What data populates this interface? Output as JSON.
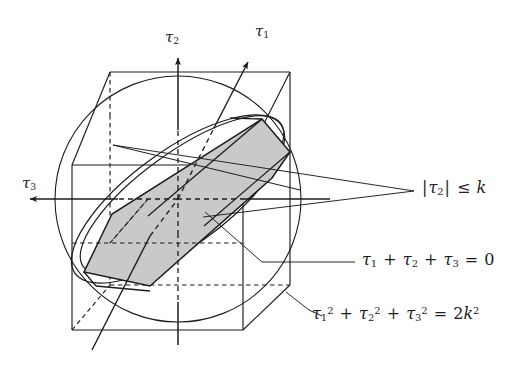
{
  "figure": {
    "background_color": "#ffffff",
    "line_color": "#1c1c1c",
    "thin_line_color": "#3a3a3a",
    "shade_color": "#c9c9c9",
    "axes": [
      {
        "id": "tau1",
        "label_tau": "τ",
        "label_sub": "1",
        "direction": "up-right",
        "style": "dashed-with-arrow"
      },
      {
        "id": "tau2",
        "label_tau": "τ",
        "label_sub": "2",
        "direction": "up",
        "style": "solid-with-arrow"
      },
      {
        "id": "tau3",
        "label_tau": "τ",
        "label_sub": "3",
        "direction": "left",
        "style": "solid-with-arrow"
      }
    ],
    "annotations": [
      {
        "id": "bound-tau2",
        "text_plain": "|τ₂| ≤ k",
        "parts": [
          {
            "t": "|",
            "k": "op"
          },
          {
            "t": "τ",
            "k": "var"
          },
          {
            "t": "2",
            "k": "sub"
          },
          {
            "t": "|",
            "k": "op"
          },
          {
            "t": "≤",
            "k": "op"
          },
          {
            "t": "k",
            "k": "var"
          }
        ],
        "describes": "pair-of-planes bounding slab"
      },
      {
        "id": "deviatoric-plane",
        "text_plain": "τ₁ + τ₂ + τ₃ = 0",
        "parts": [
          {
            "t": "τ",
            "k": "var"
          },
          {
            "t": "1",
            "k": "sub"
          },
          {
            "t": "+",
            "k": "op"
          },
          {
            "t": "τ",
            "k": "var"
          },
          {
            "t": "2",
            "k": "sub"
          },
          {
            "t": "+",
            "k": "op"
          },
          {
            "t": "τ",
            "k": "var"
          },
          {
            "t": "3",
            "k": "sub"
          },
          {
            "t": "=",
            "k": "op"
          },
          {
            "t": "0",
            "k": "num"
          }
        ],
        "describes": "the inclined plane cutting the solid"
      },
      {
        "id": "sphere",
        "text_plain": "τ₁² + τ₂² + τ₃² = 2k²",
        "parts": [
          {
            "t": "τ",
            "k": "var"
          },
          {
            "t": "1",
            "k": "sub"
          },
          {
            "t": "2",
            "k": "sup"
          },
          {
            "t": "+",
            "k": "op"
          },
          {
            "t": "τ",
            "k": "var"
          },
          {
            "t": "2",
            "k": "sub"
          },
          {
            "t": "2",
            "k": "sup"
          },
          {
            "t": "+",
            "k": "op"
          },
          {
            "t": "τ",
            "k": "var"
          },
          {
            "t": "3",
            "k": "sub"
          },
          {
            "t": "2",
            "k": "sup"
          },
          {
            "t": "=",
            "k": "op"
          },
          {
            "t": "2",
            "k": "num"
          },
          {
            "t": "k",
            "k": "var"
          },
          {
            "t": "2",
            "k": "sup"
          }
        ],
        "describes": "the sphere of radius sqrt(2)k"
      }
    ],
    "shapes": [
      {
        "id": "cube",
        "kind": "cube-wireframe",
        "note": "box with hidden edges dashed"
      },
      {
        "id": "sphere-outline",
        "kind": "circle",
        "note": "great circle silhouette of the sphere"
      },
      {
        "id": "ellipse-section",
        "kind": "ellipse",
        "note": "section of sphere by the deviatoric plane"
      },
      {
        "id": "hexagon",
        "kind": "polygon",
        "note": "shaded hexagonal cross-section of the cube by the deviatoric plane"
      }
    ]
  }
}
